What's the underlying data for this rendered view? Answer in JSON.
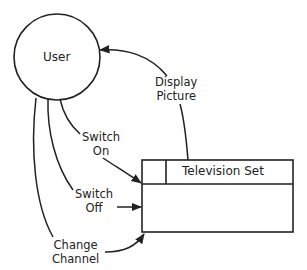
{
  "diagram": {
    "type": "context-diagram",
    "entities": {
      "user": {
        "label": "User",
        "shape": "circle"
      },
      "tv": {
        "label": "Television Set",
        "shape": "process-box"
      }
    },
    "flows": [
      {
        "id": "display",
        "line1": "Display",
        "line2": "Picture",
        "from": "Television Set",
        "to": "User"
      },
      {
        "id": "on",
        "line1": "Switch",
        "line2": "On",
        "from": "User",
        "to": "Television Set"
      },
      {
        "id": "off",
        "line1": "Switch",
        "line2": "Off",
        "from": "User",
        "to": "Television Set"
      },
      {
        "id": "channel",
        "line1": "Change",
        "line2": "Channel",
        "from": "User",
        "to": "Television Set"
      }
    ],
    "colors": {
      "stroke": "#222222",
      "background": "#ffffff"
    }
  }
}
